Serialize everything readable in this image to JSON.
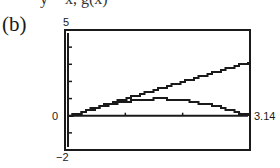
{
  "figure": {
    "cut_off_top_text": "y = x, g(x)",
    "panel_label": "(b)"
  },
  "axes": {
    "y_max_label": "5",
    "y_zero_label": "0",
    "y_min_label": "−2",
    "x_max_label": "3.14"
  },
  "chart_data": {
    "type": "line",
    "title": "(b)",
    "xlabel": "",
    "ylabel": "",
    "xlim": [
      0,
      3.14
    ],
    "ylim": [
      -2,
      5
    ],
    "x_ticks": [
      1,
      2,
      3
    ],
    "y_ticks": [
      -2,
      -1,
      0,
      1,
      2,
      3,
      4,
      5
    ],
    "tick_labels": {
      "y_top": "5",
      "y_origin": "0",
      "y_bottom": "-2",
      "x_right": "3.14"
    },
    "grid": false,
    "legend": null,
    "series": [
      {
        "name": "y = x",
        "x": [
          0,
          0.5,
          1,
          1.5,
          2,
          2.5,
          3,
          3.14
        ],
        "y": [
          0,
          0.5,
          1,
          1.5,
          2,
          2.5,
          3,
          3.14
        ]
      },
      {
        "name": "y = sin x",
        "x": [
          0,
          0.5,
          1,
          1.57,
          2,
          2.5,
          3,
          3.14
        ],
        "y": [
          0,
          0.48,
          0.84,
          1.0,
          0.91,
          0.6,
          0.14,
          0.0
        ]
      }
    ]
  }
}
